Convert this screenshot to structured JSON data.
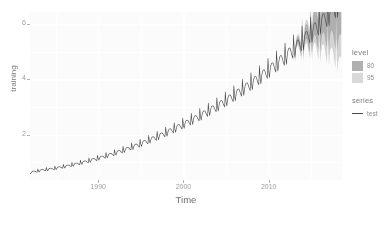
{
  "axes": {
    "x": {
      "label": "Time",
      "ticks": [
        {
          "value": 1990,
          "label": "1990"
        },
        {
          "value": 2000,
          "label": "2000"
        },
        {
          "value": 2010,
          "label": "2010"
        }
      ]
    },
    "y": {
      "label": "training",
      "ticks": [
        {
          "value": 2,
          "label": "2"
        },
        {
          "value": 4,
          "label": "4"
        },
        {
          "value": 6,
          "label": "6"
        }
      ]
    }
  },
  "legend": {
    "level": {
      "title": "level",
      "items": [
        {
          "label": "80",
          "color": "#b0b0b0"
        },
        {
          "label": "95",
          "color": "#d9d9d9"
        }
      ]
    },
    "series": {
      "title": "series",
      "items": [
        {
          "label": "test",
          "color": "#4a4a4a"
        }
      ]
    }
  },
  "chart_data": {
    "type": "line",
    "title": "",
    "xlabel": "Time",
    "ylabel": "training",
    "xlim": [
      1982.0,
      2018.6
    ],
    "ylim": [
      0.35,
      6.45
    ],
    "grid": true,
    "legend_position": "right",
    "panel_background": "#fbfbfb",
    "gridline_color": "#ffffff",
    "line_color": "#4a4a4a",
    "interval_colors": {
      "80": "#b0b0b0",
      "95": "#d9d9d9"
    },
    "series": [
      {
        "name": "test",
        "kind": "observed-and-forecast",
        "forecast_start_x": 2013.0,
        "x": [
          1982.0,
          1982.08,
          1982.17,
          1982.25,
          1982.33,
          1982.42,
          1982.5,
          1982.58,
          1982.67,
          1982.75,
          1982.83,
          1982.92,
          1983.0,
          1983.25,
          1983.5,
          1983.75,
          1983.92,
          1984.0,
          1984.25,
          1984.5,
          1984.75,
          1984.92,
          1985.0,
          1985.25,
          1985.5,
          1985.75,
          1985.92,
          1986.0,
          1986.25,
          1986.5,
          1986.75,
          1986.92,
          1987.0,
          1987.25,
          1987.5,
          1987.75,
          1987.92,
          1988.0,
          1988.25,
          1988.5,
          1988.75,
          1988.92,
          1989.0,
          1989.25,
          1989.5,
          1989.75,
          1989.92,
          1990.0,
          1990.25,
          1990.5,
          1990.75,
          1990.92,
          1991.0,
          1991.25,
          1991.5,
          1991.75,
          1991.92,
          1992.0,
          1992.25,
          1992.5,
          1992.75,
          1992.92,
          1993.0,
          1993.25,
          1993.5,
          1993.75,
          1993.92,
          1994.0,
          1994.25,
          1994.5,
          1994.75,
          1994.92,
          1995.0,
          1995.25,
          1995.5,
          1995.75,
          1995.92,
          1996.0,
          1996.25,
          1996.5,
          1996.75,
          1996.92,
          1997.0,
          1997.25,
          1997.5,
          1997.75,
          1997.92,
          1998.0,
          1998.25,
          1998.5,
          1998.75,
          1998.92,
          1999.0,
          1999.25,
          1999.5,
          1999.75,
          1999.92,
          2000.0,
          2000.25,
          2000.5,
          2000.75,
          2000.92,
          2001.0,
          2001.25,
          2001.5,
          2001.75,
          2001.92,
          2002.0,
          2002.25,
          2002.5,
          2002.75,
          2002.92,
          2003.0,
          2003.25,
          2003.5,
          2003.75,
          2003.92,
          2004.0,
          2004.25,
          2004.5,
          2004.75,
          2004.92,
          2005.0,
          2005.25,
          2005.5,
          2005.75,
          2005.92,
          2006.0,
          2006.25,
          2006.5,
          2006.75,
          2006.92,
          2007.0,
          2007.25,
          2007.5,
          2007.75,
          2007.92,
          2008.0,
          2008.25,
          2008.5,
          2008.75,
          2008.92,
          2009.0,
          2009.25,
          2009.5,
          2009.75,
          2009.92,
          2010.0,
          2010.25,
          2010.5,
          2010.75,
          2010.92,
          2011.0,
          2011.25,
          2011.5,
          2011.75,
          2011.92,
          2012.0,
          2012.25,
          2012.5,
          2012.75,
          2012.92,
          2013.0,
          2013.25,
          2013.5,
          2013.75,
          2013.92,
          2014.0,
          2014.25,
          2014.5,
          2014.75,
          2014.92,
          2015.0,
          2015.25,
          2015.5,
          2015.75,
          2015.92,
          2016.0,
          2016.25,
          2016.5,
          2016.75,
          2016.92,
          2017.0,
          2017.25,
          2017.5,
          2017.75,
          2017.92,
          2018.0,
          2018.25,
          2018.5
        ],
        "y": [
          0.62,
          0.6,
          0.63,
          0.61,
          0.64,
          0.62,
          0.65,
          0.63,
          0.66,
          0.68,
          0.72,
          0.66,
          0.66,
          0.68,
          0.7,
          0.76,
          0.7,
          0.7,
          0.72,
          0.74,
          0.81,
          0.74,
          0.74,
          0.77,
          0.79,
          0.87,
          0.79,
          0.8,
          0.83,
          0.85,
          0.94,
          0.85,
          0.86,
          0.89,
          0.92,
          1.02,
          0.92,
          0.93,
          0.96,
          0.99,
          1.11,
          0.99,
          1.0,
          1.04,
          1.07,
          1.2,
          1.07,
          1.08,
          1.12,
          1.16,
          1.3,
          1.16,
          1.17,
          1.21,
          1.25,
          1.41,
          1.25,
          1.26,
          1.31,
          1.35,
          1.52,
          1.35,
          1.36,
          1.41,
          1.46,
          1.64,
          1.46,
          1.47,
          1.52,
          1.57,
          1.77,
          1.57,
          1.58,
          1.64,
          1.69,
          1.91,
          1.69,
          1.7,
          1.76,
          1.82,
          2.05,
          1.82,
          1.83,
          1.89,
          1.95,
          2.2,
          1.95,
          1.96,
          2.03,
          2.09,
          2.36,
          2.09,
          2.1,
          2.17,
          2.24,
          2.52,
          2.24,
          2.25,
          2.32,
          2.39,
          2.69,
          2.39,
          2.4,
          2.47,
          2.54,
          2.86,
          2.54,
          2.55,
          2.63,
          2.71,
          3.04,
          2.71,
          2.72,
          2.8,
          2.88,
          3.23,
          2.88,
          2.89,
          2.98,
          3.06,
          3.42,
          3.06,
          3.08,
          3.17,
          3.26,
          3.63,
          3.26,
          3.28,
          3.37,
          3.46,
          3.85,
          3.46,
          3.48,
          3.58,
          3.67,
          4.08,
          3.67,
          3.69,
          3.79,
          3.89,
          4.32,
          3.89,
          3.91,
          4.02,
          4.12,
          4.57,
          4.12,
          4.14,
          4.25,
          4.36,
          4.83,
          4.36,
          4.38,
          4.5,
          4.61,
          5.1,
          4.61,
          4.63,
          4.76,
          4.87,
          5.38,
          4.87,
          4.9,
          5.03,
          5.15,
          5.68,
          5.15,
          5.18,
          5.31,
          5.44,
          5.99,
          5.44,
          5.47,
          5.61,
          5.74,
          6.31,
          5.74,
          5.77,
          5.92,
          6.05,
          6.64,
          6.05,
          6.09,
          6.24,
          6.38,
          6.99,
          6.38,
          6.42,
          6.58,
          6.72
        ]
      }
    ]
  }
}
